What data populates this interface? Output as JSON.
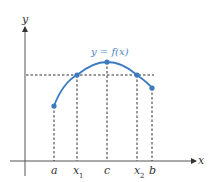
{
  "diagram": {
    "axes": {
      "x_label": "x",
      "y_label": "y"
    },
    "curve_label": "y = f(x)",
    "x_ticks": [
      {
        "name": "a",
        "main": "a",
        "sub": ""
      },
      {
        "name": "x1",
        "main": "x",
        "sub": "1"
      },
      {
        "name": "c",
        "main": "c",
        "sub": ""
      },
      {
        "name": "x2",
        "main": "x",
        "sub": "2"
      },
      {
        "name": "b",
        "main": "b",
        "sub": ""
      }
    ],
    "colors": {
      "curve": "#3a7bc0",
      "axes": "#333333",
      "dashed": "#333333"
    }
  }
}
